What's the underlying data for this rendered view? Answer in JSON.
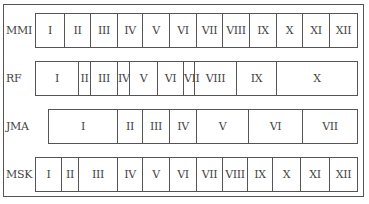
{
  "diagram": {
    "title": "",
    "rows": [
      {
        "name": "MMI",
        "top": 13,
        "cells": [
          {
            "label": "I",
            "x0": 35,
            "x1": 64
          },
          {
            "label": "II",
            "x0": 64,
            "x1": 90
          },
          {
            "label": "III",
            "x0": 90,
            "x1": 117
          },
          {
            "label": "IV",
            "x0": 117,
            "x1": 142
          },
          {
            "label": "V",
            "x0": 142,
            "x1": 169
          },
          {
            "label": "VI",
            "x0": 169,
            "x1": 196
          },
          {
            "label": "VII",
            "x0": 196,
            "x1": 222
          },
          {
            "label": "VIII",
            "x0": 222,
            "x1": 249
          },
          {
            "label": "IX",
            "x0": 249,
            "x1": 276
          },
          {
            "label": "X",
            "x0": 276,
            "x1": 302
          },
          {
            "label": "XI",
            "x0": 302,
            "x1": 329
          },
          {
            "label": "XII",
            "x0": 329,
            "x1": 357
          }
        ]
      },
      {
        "name": "RF",
        "top": 61,
        "cells": [
          {
            "label": "I",
            "x0": 35,
            "x1": 78
          },
          {
            "label": "II",
            "x0": 78,
            "x1": 90
          },
          {
            "label": "III",
            "x0": 90,
            "x1": 117
          },
          {
            "label": "IV",
            "x0": 117,
            "x1": 129
          },
          {
            "label": "V",
            "x0": 129,
            "x1": 157
          },
          {
            "label": "VI",
            "x0": 157,
            "x1": 183
          },
          {
            "label": "VII",
            "x0": 183,
            "x1": 194
          },
          {
            "label": "VIII",
            "x0": 194,
            "x1": 236
          },
          {
            "label": "IX",
            "x0": 236,
            "x1": 276
          },
          {
            "label": "X",
            "x0": 276,
            "x1": 357
          }
        ]
      },
      {
        "name": "JMA",
        "top": 109,
        "cells": [
          {
            "label": "I",
            "x0": 48,
            "x1": 117
          },
          {
            "label": "II",
            "x0": 117,
            "x1": 142
          },
          {
            "label": "III",
            "x0": 142,
            "x1": 169
          },
          {
            "label": "IV",
            "x0": 169,
            "x1": 196
          },
          {
            "label": "V",
            "x0": 196,
            "x1": 248
          },
          {
            "label": "VI",
            "x0": 248,
            "x1": 302
          },
          {
            "label": "VII",
            "x0": 302,
            "x1": 357
          }
        ]
      },
      {
        "name": "MSK",
        "top": 157,
        "cells": [
          {
            "label": "I",
            "x0": 35,
            "x1": 61
          },
          {
            "label": "II",
            "x0": 61,
            "x1": 78
          },
          {
            "label": "III",
            "x0": 78,
            "x1": 117
          },
          {
            "label": "IV",
            "x0": 117,
            "x1": 142
          },
          {
            "label": "V",
            "x0": 142,
            "x1": 169
          },
          {
            "label": "VI",
            "x0": 169,
            "x1": 196
          },
          {
            "label": "VII",
            "x0": 196,
            "x1": 222
          },
          {
            "label": "VIII",
            "x0": 222,
            "x1": 247
          },
          {
            "label": "IX",
            "x0": 247,
            "x1": 272
          },
          {
            "label": "X",
            "x0": 272,
            "x1": 300
          },
          {
            "label": "XI",
            "x0": 300,
            "x1": 329
          },
          {
            "label": "XII",
            "x0": 329,
            "x1": 357
          }
        ]
      }
    ],
    "colors": {
      "line": "#555555",
      "text": "#444444",
      "background": "#ffffff"
    }
  }
}
